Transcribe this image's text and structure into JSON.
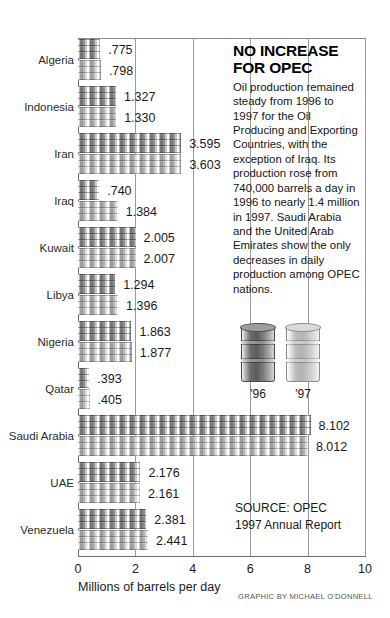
{
  "chart_data": {
    "type": "bar",
    "title": "NO INCREASE FOR OPEC",
    "xlabel": "Millions of barrels per day",
    "ylabel": "",
    "xlim": [
      0,
      10
    ],
    "xticks": [
      "0",
      "2",
      "4",
      "6",
      "8",
      "10"
    ],
    "grid": true,
    "orientation": "horizontal",
    "categories": [
      "Algeria",
      "Indonesia",
      "Iran",
      "Iraq",
      "Kuwait",
      "Libya",
      "Nigeria",
      "Qatar",
      "Saudi Arabia",
      "UAE",
      "Venezuela"
    ],
    "series": [
      {
        "name": "'96",
        "values": [
          0.775,
          1.327,
          3.595,
          0.74,
          2.005,
          1.294,
          1.863,
          0.393,
          8.102,
          2.176,
          2.381
        ],
        "labels": [
          ".775",
          "1.327",
          "3.595",
          ".740",
          "2.005",
          "1.294",
          "1.863",
          ".393",
          "8.102",
          "2.176",
          "2.381"
        ]
      },
      {
        "name": "'97",
        "values": [
          0.798,
          1.33,
          3.603,
          1.384,
          2.007,
          1.396,
          1.877,
          0.405,
          8.012,
          2.161,
          2.441
        ],
        "labels": [
          ".798",
          "1.330",
          "3.603",
          "1.384",
          "2.007",
          "1.396",
          "1.877",
          ".405",
          "8.012",
          "2.161",
          "2.441"
        ]
      }
    ],
    "legend": {
      "position": "right-inset",
      "entries": [
        "'96",
        "'97"
      ]
    },
    "source": "SOURCE: OPEC 1997 Annual Report"
  },
  "story": {
    "headline": "NO INCREASE FOR OPEC",
    "body": "Oil production remained steady from 1996 to 1997 for the Oil Producing and Exporting Countries, with the exception of Iraq. Its production rose from 740,000 barrels a day in 1996 to nearly 1.4 million in 1997. Saudi Arabia and the United Arab Emirates show the only decreases in daily production among OPEC nations."
  },
  "legend": {
    "items": [
      {
        "year": "'96",
        "shade": "dark"
      },
      {
        "year": "'97",
        "shade": "light"
      }
    ]
  },
  "source": {
    "line1": "SOURCE: OPEC",
    "line2": "1997 Annual Report"
  },
  "credit": "GRAPHIC BY MICHAEL O'DONNELL",
  "axis": {
    "title": "Millions of barrels per day"
  },
  "colors": {
    "bar96": "#767676",
    "bar97": "#b4b4b4",
    "frame": "#8a8a8a",
    "text": "#1a1a1a"
  }
}
